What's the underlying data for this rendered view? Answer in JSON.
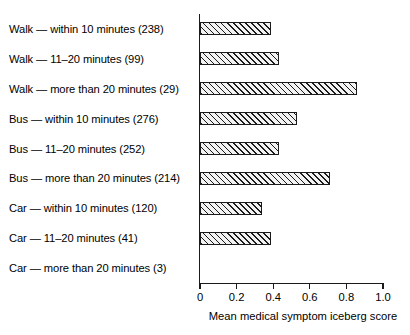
{
  "chart_data": {
    "type": "bar",
    "orientation": "horizontal",
    "title": "",
    "xlabel": "Mean medical symptom iceberg score",
    "ylabel": "",
    "xlim": [
      0,
      1.0
    ],
    "grid": false,
    "legend": null,
    "xticks": [
      "0",
      "0.2",
      "0.4",
      "0.6",
      "0.8",
      "1.0"
    ],
    "xtick_values": [
      0,
      0.2,
      0.4,
      0.6,
      0.8,
      1.0
    ],
    "categories": [
      "Walk — within 10 minutes (238)",
      "Walk — 11–20 minutes (99)",
      "Walk — more than 20 minutes (29)",
      "Bus — within 10 minutes (276)",
      "Bus — 11–20 minutes (252)",
      "Bus — more than 20 minutes (214)",
      "Car — within 10 minutes (120)",
      "Car — 11–20 minutes (41)",
      "Car — more than 20 minutes (3)"
    ],
    "counts": [
      238,
      99,
      29,
      276,
      252,
      214,
      120,
      41,
      3
    ],
    "values": [
      0.39,
      0.43,
      0.86,
      0.53,
      0.43,
      0.71,
      0.34,
      0.39,
      0.0
    ]
  },
  "style": {
    "bar_edge_color": "#1a1a1a",
    "bar_fill_color": "#f2f2f2",
    "axis_color": "#1a1a1a",
    "text_color": "#000000",
    "background": "#ffffff"
  }
}
